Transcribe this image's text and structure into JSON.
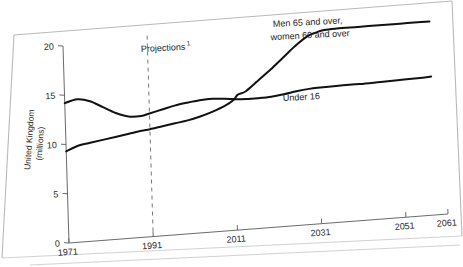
{
  "figure": {
    "background_color": "#ffffff",
    "line_color": "#111111",
    "axis_color": "#6b6b6b",
    "projection_color": "#767676",
    "page_edge_color": "#b9b9b9"
  },
  "axis": {
    "ylabel_line1": "United Kingdom",
    "ylabel_line2": "(millions)",
    "y_ticks": [
      "0",
      "5",
      "10",
      "15",
      "20"
    ],
    "x_ticks": [
      "1971",
      "1991",
      "2011",
      "2031",
      "2051",
      "2061"
    ]
  },
  "annotations": {
    "projections": "Projections",
    "projections_superscript": "1",
    "elderly_line1": "Men 65 and over,",
    "elderly_line2": "women 60 and over",
    "under16": "Under 16"
  },
  "chart_data": {
    "type": "line",
    "title": "",
    "xlabel": "",
    "ylabel": "United Kingdom (millions)",
    "xlim": [
      1971,
      2061
    ],
    "ylim": [
      0,
      20
    ],
    "grid": false,
    "legend": "inline-annotations",
    "x_tick_values": [
      1971,
      1991,
      2011,
      2031,
      2051,
      2061
    ],
    "y_tick_values": [
      0,
      5,
      10,
      15,
      20
    ],
    "projection_start_year": 1991,
    "series": [
      {
        "name": "Under 16",
        "x": [
          1971,
          1974,
          1977,
          1980,
          1983,
          1986,
          1989,
          1991,
          1994,
          1997,
          2000,
          2003,
          2006,
          2009,
          2011,
          2014,
          2017,
          2020,
          2023,
          2026,
          2029,
          2031,
          2036,
          2041,
          2046,
          2051,
          2056,
          2058
        ],
        "values": [
          14.2,
          14.5,
          14.2,
          13.5,
          12.8,
          12.35,
          12.3,
          12.5,
          12.8,
          13.1,
          13.3,
          13.45,
          13.5,
          13.4,
          13.3,
          13.2,
          13.2,
          13.25,
          13.4,
          13.6,
          13.75,
          13.8,
          13.85,
          13.85,
          13.9,
          13.95,
          14.0,
          14.05
        ]
      },
      {
        "name": "Men 65 and over, women 60 and over",
        "x": [
          1971,
          1974,
          1977,
          1980,
          1983,
          1986,
          1989,
          1991,
          1994,
          1997,
          2000,
          2003,
          2006,
          2009,
          2011,
          2012,
          2014,
          2017,
          2020,
          2023,
          2026,
          2029,
          2031,
          2033,
          2036,
          2041,
          2046,
          2051,
          2056,
          2058
        ],
        "values": [
          9.3,
          9.8,
          10.0,
          10.2,
          10.4,
          10.6,
          10.8,
          10.9,
          11.1,
          11.3,
          11.5,
          11.8,
          12.2,
          12.7,
          13.2,
          13.7,
          14.0,
          15.0,
          16.0,
          17.1,
          18.2,
          19.1,
          19.4,
          19.6,
          19.65,
          19.65,
          19.65,
          19.65,
          19.65,
          19.65
        ]
      }
    ]
  }
}
